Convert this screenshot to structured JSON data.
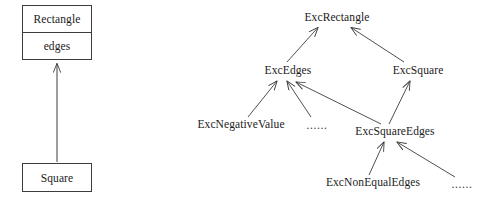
{
  "figure": {
    "background_color": "#ffffff",
    "line_color": "#3c3c3c",
    "text_color": "#1a1a1a"
  },
  "class_diagram": {
    "name": "rectangle-square-class-diagram",
    "classes": [
      {
        "id": "rectangle",
        "name": "Rectangle",
        "attributes": [
          "edges"
        ]
      },
      {
        "id": "square",
        "name": "Square",
        "attributes": []
      }
    ],
    "generalizations": [
      {
        "from": "Square",
        "to": "Rectangle"
      }
    ]
  },
  "exception_hierarchy": {
    "name": "exception-class-hierarchy",
    "nodes": [
      {
        "id": "exc_rectangle",
        "label": "ExcRectangle"
      },
      {
        "id": "exc_edges",
        "label": "ExcEdges"
      },
      {
        "id": "exc_square",
        "label": "ExcSquare"
      },
      {
        "id": "exc_negative_value",
        "label": "ExcNegativeValue"
      },
      {
        "id": "ellipsis_edges",
        "label": "......"
      },
      {
        "id": "exc_square_edges",
        "label": "ExcSquareEdges"
      },
      {
        "id": "exc_non_equal_edges",
        "label": "ExcNonEqualEdges"
      },
      {
        "id": "ellipsis_square_edges",
        "label": "......"
      }
    ],
    "edges": [
      {
        "from": "exc_edges",
        "to": "exc_rectangle"
      },
      {
        "from": "exc_square",
        "to": "exc_rectangle"
      },
      {
        "from": "exc_negative_value",
        "to": "exc_edges"
      },
      {
        "from": "ellipsis_edges",
        "to": "exc_edges"
      },
      {
        "from": "exc_square_edges",
        "to": "exc_edges"
      },
      {
        "from": "exc_square_edges",
        "to": "exc_square"
      },
      {
        "from": "exc_non_equal_edges",
        "to": "exc_square_edges"
      },
      {
        "from": "ellipsis_square_edges",
        "to": "exc_square_edges"
      }
    ]
  }
}
